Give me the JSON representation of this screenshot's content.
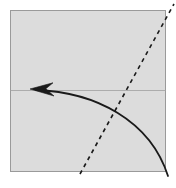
{
  "diagram": {
    "type": "origami-fold-step",
    "background_color": "#ffffff",
    "paper": {
      "name": "square sheet",
      "shape": "square",
      "fill_color": "#dcdcdc",
      "border_color": "#9a9a9a",
      "border_width": 1,
      "bounds": {
        "x": 10,
        "y": 10,
        "width": 156,
        "height": 162
      }
    },
    "existing_crease": {
      "name": "horizontal crease",
      "style": "thin solid line",
      "color": "#a0a0a0",
      "width": 0.8,
      "from": {
        "x": 10,
        "y": 90
      },
      "to": {
        "x": 166,
        "y": 90
      }
    },
    "fold_line": {
      "name": "valley fold line",
      "style": "dashed",
      "color": "#1a1a1a",
      "width": 1.6,
      "dash_pattern": "4 4",
      "from": {
        "x": 80,
        "y": 174
      },
      "to": {
        "x": 174,
        "y": 4
      }
    },
    "fold_arrow": {
      "name": "fold direction arrow",
      "style": "solid curved arrow",
      "color": "#1a1a1a",
      "width": 1.8,
      "direction": "right-bottom to left",
      "start": {
        "x": 168,
        "y": 176
      },
      "control_1": {
        "x": 150,
        "y": 120
      },
      "control_2": {
        "x": 95,
        "y": 92
      },
      "end": {
        "x": 36,
        "y": 90
      },
      "arrowhead": {
        "name": "arrowhead",
        "shape": "narrow-v",
        "tip": {
          "x": 30,
          "y": 89
        },
        "length": 22,
        "half_width": 7
      }
    }
  }
}
